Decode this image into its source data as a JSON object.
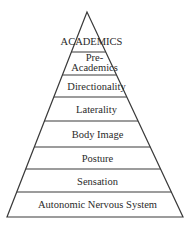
{
  "diagram": {
    "type": "pyramid",
    "line_color": "#3a3a3a",
    "background": "#ffffff",
    "levels": [
      {
        "label": "ACADEMICS",
        "lines": [
          "ACADEMICS"
        ]
      },
      {
        "label": "Pre-Academics",
        "lines": [
          "Pre-",
          "Academics"
        ]
      },
      {
        "label": "Directionality",
        "lines": [
          "Directionality"
        ]
      },
      {
        "label": "Laterality",
        "lines": [
          "Laterality"
        ]
      },
      {
        "label": "Body Image",
        "lines": [
          "Body Image"
        ]
      },
      {
        "label": "Posture",
        "lines": [
          "Posture"
        ]
      },
      {
        "label": "Sensation",
        "lines": [
          "Sensation"
        ]
      },
      {
        "label": "Autonomic Nervous System",
        "lines": [
          "Autonomic Nervous System"
        ]
      }
    ]
  }
}
